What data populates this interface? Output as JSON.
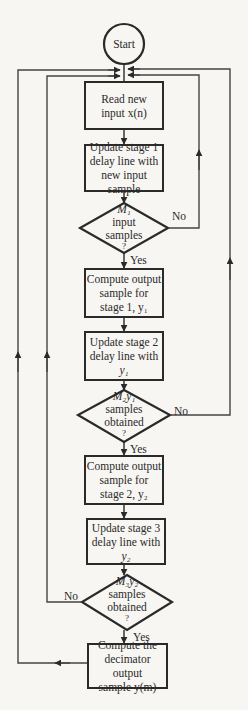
{
  "diagram": {
    "type": "flowchart",
    "start": {
      "label": "Start"
    },
    "nodes": [
      {
        "id": "read",
        "kind": "process",
        "lines": [
          "Read new",
          "input x(n)"
        ]
      },
      {
        "id": "update1",
        "kind": "process",
        "lines": [
          "Update stage 1",
          "delay line with",
          "new input sample"
        ]
      },
      {
        "id": "dec1",
        "kind": "decision",
        "lines": [
          "M₁",
          "input",
          "samples",
          "?"
        ],
        "yes": "Yes",
        "no": "No"
      },
      {
        "id": "compute1",
        "kind": "process",
        "lines": [
          "Compute output",
          "sample for",
          "stage 1, y₁"
        ]
      },
      {
        "id": "update2",
        "kind": "process",
        "lines": [
          "Update stage 2",
          "delay line with",
          "y₁"
        ]
      },
      {
        "id": "dec2",
        "kind": "decision",
        "lines": [
          "M₂y₁",
          "samples",
          "obtained",
          "?"
        ],
        "yes": "Yes",
        "no": "No"
      },
      {
        "id": "compute2",
        "kind": "process",
        "lines": [
          "Compute output",
          "sample for",
          "stage 2, y₂"
        ]
      },
      {
        "id": "update3",
        "kind": "process",
        "lines": [
          "Update stage 3",
          "delay line with",
          "y₂"
        ]
      },
      {
        "id": "dec3",
        "kind": "decision",
        "lines": [
          "M₃y₂",
          "samples",
          "obtained",
          "?"
        ],
        "yes": "Yes",
        "no": "No"
      },
      {
        "id": "output",
        "kind": "process",
        "lines": [
          "Compute the",
          "decimator output",
          "sample y(m)"
        ]
      }
    ],
    "edges": [
      {
        "from": "start",
        "to": "read"
      },
      {
        "from": "read",
        "to": "update1"
      },
      {
        "from": "update1",
        "to": "dec1"
      },
      {
        "from": "dec1",
        "to": "compute1",
        "label": "Yes"
      },
      {
        "from": "dec1",
        "to": "read",
        "label": "No"
      },
      {
        "from": "compute1",
        "to": "update2"
      },
      {
        "from": "update2",
        "to": "dec2"
      },
      {
        "from": "dec2",
        "to": "compute2",
        "label": "Yes"
      },
      {
        "from": "dec2",
        "to": "read",
        "label": "No"
      },
      {
        "from": "compute2",
        "to": "update3"
      },
      {
        "from": "update3",
        "to": "dec3"
      },
      {
        "from": "dec3",
        "to": "output",
        "label": "Yes"
      },
      {
        "from": "dec3",
        "to": "read",
        "label": "No"
      },
      {
        "from": "output",
        "to": "read"
      }
    ],
    "colors": {
      "line": "#2a2a2a",
      "background": "#f8f6f2",
      "feedback": "#555555"
    }
  }
}
